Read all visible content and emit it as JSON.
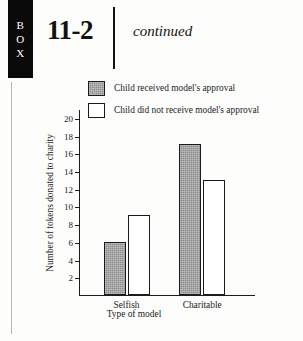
{
  "box_tab": {
    "letters": [
      "B",
      "O",
      "X"
    ]
  },
  "header": {
    "number": "11-2",
    "continued": "continued"
  },
  "chart_data": {
    "type": "bar",
    "title": "",
    "categories": [
      "Selfish",
      "Charitable"
    ],
    "series": [
      {
        "name": "Child received model's approval",
        "values": [
          6,
          17
        ],
        "style": "filled",
        "color": "#8d8d8d"
      },
      {
        "name": "Child did not receive model's approval",
        "values": [
          9,
          13
        ],
        "style": "open",
        "color": "#ffffff"
      }
    ],
    "xlabel": "Type of model",
    "ylabel": "Number of tokens donated to charity",
    "ylim": [
      0,
      21
    ],
    "yticks": [
      2,
      4,
      6,
      8,
      10,
      12,
      14,
      16,
      18,
      20
    ],
    "ytick_labels": [
      "2",
      "4",
      "6",
      "8",
      "10",
      "12",
      "14",
      "16",
      "18",
      "20"
    ],
    "grid": false,
    "legend_position": "top"
  },
  "legend": {
    "items": [
      {
        "label": "Child received model's approval",
        "swatch": "filled"
      },
      {
        "label": "Child did not receive model's approval",
        "swatch": "open"
      }
    ]
  },
  "footer": {
    "clipped_line": "a page of continuing body text partially visible"
  }
}
